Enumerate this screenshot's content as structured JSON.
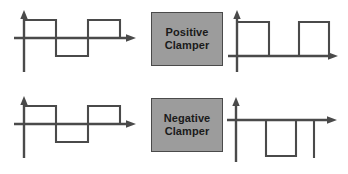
{
  "diagram": {
    "colors": {
      "line": "#4a4a4a",
      "box_fill": "#9c9c9c",
      "box_border": "#4a4a4a",
      "text": "#1a1a1a",
      "background": "#ffffff"
    },
    "blocks": [
      {
        "id": "positive-clamper",
        "line1": "Positive",
        "line2": "Clamper"
      },
      {
        "id": "negative-clamper",
        "line1": "Negative",
        "line2": "Clamper"
      }
    ],
    "waveforms": [
      {
        "id": "top-input",
        "role": "input",
        "description": "bipolar square wave centered on the time axis",
        "axis_label": "",
        "points": "8,30 14,30 14,12 46,12 46,48 78,48 78,12 110,12 110,30 124,30"
      },
      {
        "id": "top-output",
        "role": "output",
        "description": "square wave clamped so the entire waveform sits above the time axis",
        "axis_label": "",
        "points": "8,48 14,48 14,12 46,12 46,48 78,48 78,12 110,12 110,48 124,48"
      },
      {
        "id": "bottom-input",
        "role": "input",
        "description": "bipolar square wave centered on the time axis",
        "axis_label": "",
        "points": "8,30 14,30 14,12 46,12 46,48 78,48 78,12 110,12 110,30 124,30"
      },
      {
        "id": "bottom-output",
        "role": "output",
        "description": "square wave clamped so the entire waveform sits below the time axis",
        "axis_label": "",
        "points": "8,14 46,14 46,50 78,50 78,14 110,14 110,50 116,50"
      }
    ]
  }
}
